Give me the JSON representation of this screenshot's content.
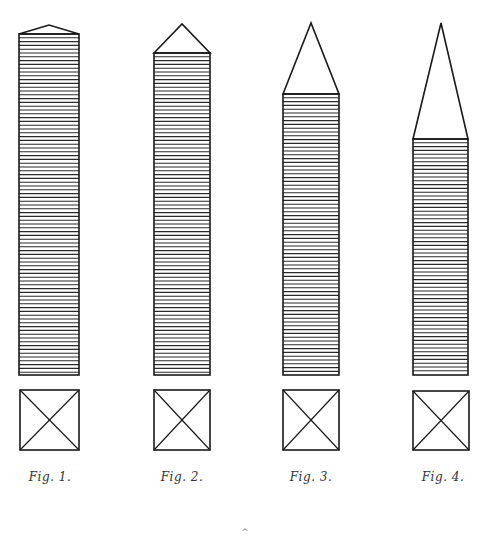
{
  "plate": {
    "background": "#ffffff",
    "ink": "#1a1a1a",
    "hatch_spacing_px": 3.8,
    "shaft_bottom_y": 375
  },
  "figures": [
    {
      "label": "Fig. 1.",
      "shaft": {
        "left": 19,
        "right": 79,
        "top": 34
      },
      "apex": {
        "x": 49,
        "y": 25
      },
      "plan": {
        "left": 20,
        "right": 79,
        "top": 390,
        "bottom": 450
      },
      "label_pos": {
        "x": 50,
        "y": 470
      }
    },
    {
      "label": "Fig. 2.",
      "shaft": {
        "left": 154,
        "right": 210,
        "top": 53
      },
      "apex": {
        "x": 182,
        "y": 24
      },
      "plan": {
        "left": 154,
        "right": 210,
        "top": 390,
        "bottom": 450
      },
      "label_pos": {
        "x": 182,
        "y": 470
      }
    },
    {
      "label": "Fig. 3.",
      "shaft": {
        "left": 283,
        "right": 339,
        "top": 94
      },
      "apex": {
        "x": 311,
        "y": 23
      },
      "plan": {
        "left": 283,
        "right": 339,
        "top": 390,
        "bottom": 450
      },
      "label_pos": {
        "x": 311,
        "y": 470
      }
    },
    {
      "label": "Fig. 4.",
      "shaft": {
        "left": 413,
        "right": 468,
        "top": 139
      },
      "apex": {
        "x": 441,
        "y": 23
      },
      "plan": {
        "left": 413,
        "right": 469,
        "top": 391,
        "bottom": 450
      },
      "label_pos": {
        "x": 443,
        "y": 470
      }
    }
  ],
  "footer_mark": {
    "glyph": "^",
    "x": 245,
    "y": 527
  }
}
